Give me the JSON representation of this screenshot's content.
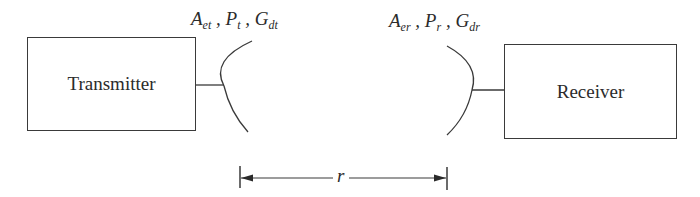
{
  "diagram": {
    "transmitter": {
      "label": "Transmitter",
      "antenna_params": [
        {
          "symbol": "A",
          "sub": "et",
          "sep": " , "
        },
        {
          "symbol": "P",
          "sub": "t",
          "sep": " , "
        },
        {
          "symbol": "G",
          "sub": "dt",
          "sep": ""
        }
      ]
    },
    "receiver": {
      "label": "Receiver",
      "antenna_params": [
        {
          "symbol": "A",
          "sub": "er",
          "sep": " , "
        },
        {
          "symbol": "P",
          "sub": "r",
          "sep": " , "
        },
        {
          "symbol": "G",
          "sub": "dr",
          "sep": ""
        }
      ]
    },
    "distance": {
      "label": "r"
    },
    "colors": {
      "stroke": "#3a3a3a",
      "background": "#ffffff"
    }
  }
}
